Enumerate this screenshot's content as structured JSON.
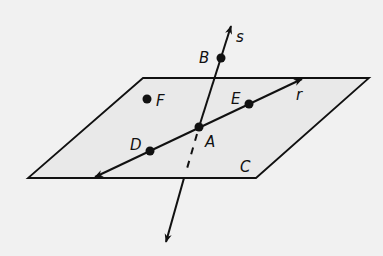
{
  "diagram": {
    "colors": {
      "background": "#f1f1f1",
      "plane_fill": "#e9e9e9",
      "stroke": "#111111"
    },
    "plane": {
      "label": "C"
    },
    "lines": [
      {
        "id": "r",
        "label": "r",
        "points": [
          "D",
          "A",
          "E"
        ]
      },
      {
        "id": "s",
        "label": "s",
        "points": [
          "B",
          "A"
        ]
      }
    ],
    "points": [
      {
        "id": "A",
        "label": "A"
      },
      {
        "id": "B",
        "label": "B"
      },
      {
        "id": "D",
        "label": "D"
      },
      {
        "id": "E",
        "label": "E"
      },
      {
        "id": "F",
        "label": "F"
      }
    ]
  }
}
